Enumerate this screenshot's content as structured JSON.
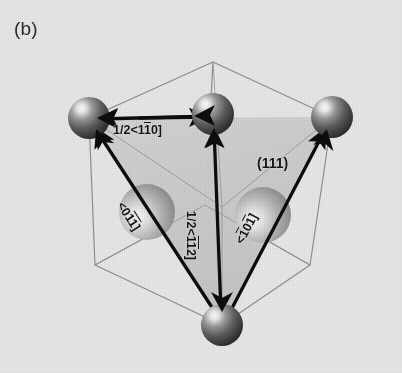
{
  "figure": {
    "panel_label": "(b)",
    "caption_labels": {
      "plane": "(111)",
      "burgers_top": "1/2<1̅1̅0]",
      "burgers_vertical": "1/2<̅1̅1̅2]",
      "partial_left": "<0̅1̅1]",
      "partial_right": "<̅1̅0̅1]"
    },
    "labels": {
      "top_edge_vector": "1/2<110]",
      "top_edge_vector_display": "1/2<11̅0]",
      "vertical_vector_display": "1/2<1̅1̅2]",
      "left_sphere_display": "<01̅1̅]",
      "right_sphere_display": "<1̅011̅]",
      "plane_index": "(111)"
    },
    "text": {
      "panel": "(b)",
      "vec_top_a": "1/2<1",
      "vec_top_bar": "1",
      "vec_top_b": "0]",
      "vec_vert_a": "1/2<",
      "vec_vert_bar1": "1",
      "vec_vert_bar2": "1",
      "vec_vert_b": "2]",
      "vec_left_a": "<0",
      "vec_left_bar1": "1",
      "vec_left_bar2": "1",
      "vec_left_b": "]",
      "vec_right_a": "<",
      "vec_right_bar1": "1",
      "vec_right_mid": "0",
      "vec_right_bar2": "1",
      "vec_right_b": "]",
      "plane": "(111)"
    },
    "colors": {
      "background": "#e8e8e8",
      "wireframe": "#8f8f8f",
      "slip_plane_fill": "#cfcfcf",
      "arrow": "#0d0d0d",
      "sphere_dark": "#575757",
      "sphere_light": "#b4b4b4",
      "text": "#151515"
    },
    "geometry": {
      "cube_corners": {
        "front_bottom": [
          222,
          325
        ],
        "left_bottom": [
          95,
          265
        ],
        "right_bottom": [
          310,
          265
        ],
        "back_bottom": [
          205,
          205
        ],
        "front_top": [
          222,
          207
        ],
        "left_top": [
          89,
          118
        ],
        "right_top": [
          332,
          117
        ],
        "back_top": [
          213,
          62
        ]
      },
      "atoms": [
        {
          "name": "corner-top-left",
          "cx": 89,
          "cy": 118,
          "r": 21,
          "shade": "dark"
        },
        {
          "name": "corner-top-mid",
          "cx": 213,
          "cy": 114,
          "r": 21,
          "shade": "dark"
        },
        {
          "name": "corner-top-right",
          "cx": 332,
          "cy": 117,
          "r": 21,
          "shade": "dark"
        },
        {
          "name": "corner-bottom-front",
          "cx": 222,
          "cy": 325,
          "r": 21,
          "shade": "dark"
        },
        {
          "name": "interior-left",
          "cx": 147,
          "cy": 212,
          "r": 28,
          "shade": "light"
        },
        {
          "name": "interior-right",
          "cx": 263,
          "cy": 215,
          "r": 28,
          "shade": "light"
        }
      ]
    }
  }
}
